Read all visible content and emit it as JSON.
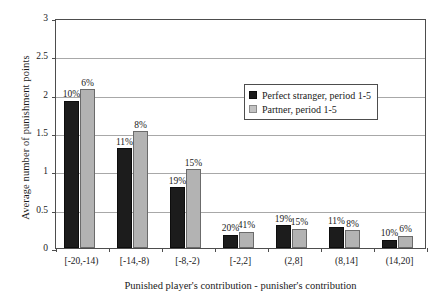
{
  "chart_data": {
    "type": "bar",
    "title": "",
    "xlabel": "Punished player's contribution - punisher's contribution",
    "ylabel": "Average number of punishment points",
    "ylim": [
      0,
      3
    ],
    "ytick_labels": [
      "0",
      "0.5",
      "1",
      "1.5",
      "2",
      "2.5",
      "3"
    ],
    "ytick_values": [
      0,
      0.5,
      1,
      1.5,
      2,
      2.5,
      3
    ],
    "grid": true,
    "legend_position": "upper-right-inside",
    "categories": [
      "[-20,-14)",
      "[-14,-8)",
      "[-8,-2)",
      "[-2,2]",
      "(2,8]",
      "(8,14]",
      "(14,20]"
    ],
    "series": [
      {
        "name": "Perfect stranger,  period 1-5",
        "color": "#1c1c1c",
        "values": [
          1.92,
          1.3,
          0.79,
          0.17,
          0.3,
          0.27,
          0.11
        ],
        "point_labels": [
          "10%",
          "11%",
          "19%",
          "20%",
          "19%",
          "11%",
          "10%"
        ]
      },
      {
        "name": "Partner,  period 1-5",
        "color": "#b3b3b3",
        "values": [
          2.07,
          1.52,
          1.03,
          0.21,
          0.25,
          0.23,
          0.16
        ],
        "point_labels": [
          "6%",
          "8%",
          "15%",
          "41%",
          "15%",
          "8%",
          "6%"
        ]
      }
    ]
  },
  "legend": {
    "items": [
      {
        "label": "Perfect stranger,  period 1-5",
        "swatch": "black-square-icon"
      },
      {
        "label": "Partner,  period 1-5",
        "swatch": "gray-square-icon"
      }
    ]
  }
}
